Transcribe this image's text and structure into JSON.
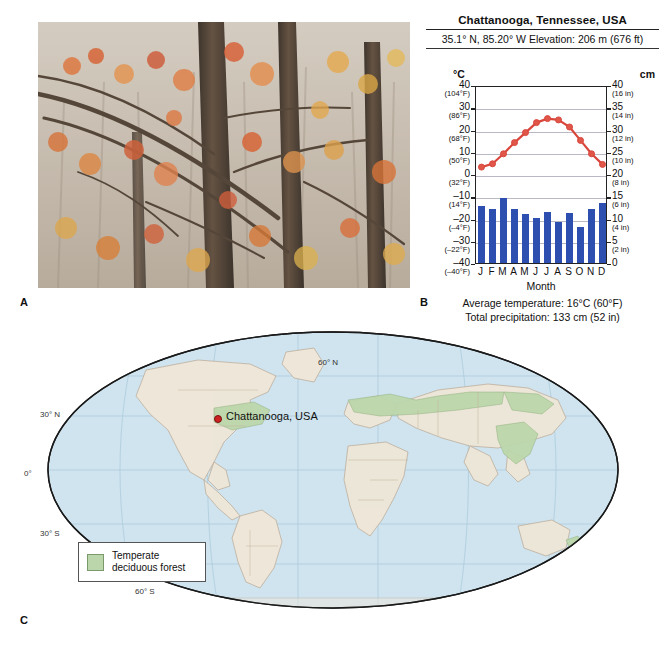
{
  "panels": {
    "a": "A",
    "b": "B",
    "c": "C"
  },
  "photo": {
    "alt": "autumn-deciduous-forest-photo"
  },
  "climograph": {
    "title": "Chattanooga, Tennessee, USA",
    "coords": "35.1° N, 85.20° W   Elevation: 206 m (676 ft)",
    "left_unit": "°C",
    "right_unit": "cm",
    "month_axis_label": "Month",
    "avg_temp": "Average temperature: 16°C (60°F)",
    "total_precip": "Total precipitation: 133 cm (52 in)",
    "left_ticks": [
      {
        "v": "40",
        "f": "(104°F)"
      },
      {
        "v": "30",
        "f": "(86°F)"
      },
      {
        "v": "20",
        "f": "(68°F)"
      },
      {
        "v": "10",
        "f": "(50°F)"
      },
      {
        "v": "0",
        "f": "(32°F)"
      },
      {
        "v": "–10",
        "f": "(14°F)"
      },
      {
        "v": "–20",
        "f": "(–4°F)"
      },
      {
        "v": "–30",
        "f": "(–22°F)"
      },
      {
        "v": "–40",
        "f": "(–40°F)"
      }
    ],
    "right_ticks": [
      {
        "v": "40",
        "f": "(16 in)"
      },
      {
        "v": "35",
        "f": "(14 in)"
      },
      {
        "v": "30",
        "f": "(12 in)"
      },
      {
        "v": "25",
        "f": "(10 in)"
      },
      {
        "v": "20",
        "f": "(8 in)"
      },
      {
        "v": "15",
        "f": "(6 in)"
      },
      {
        "v": "10",
        "f": "(4 in)"
      },
      {
        "v": "5",
        "f": "(2 in)"
      },
      {
        "v": "0",
        "f": ""
      }
    ],
    "colors": {
      "temp_line": "#d9463c",
      "temp_marker": "#e0574a",
      "precip_bar": "#2c4fb0",
      "grid": "#b9b9c6"
    }
  },
  "chart_data": {
    "type": "line",
    "title": "Chattanooga, Tennessee, USA",
    "subtitle": "35.1° N, 85.20° W   Elevation: 206 m (676 ft)",
    "xlabel": "Month",
    "ylabel": "°C",
    "y2label": "cm",
    "grid": true,
    "legend": "none",
    "categories": [
      "J",
      "F",
      "M",
      "A",
      "M",
      "J",
      "J",
      "A",
      "S",
      "O",
      "N",
      "D"
    ],
    "x_ticklabels": [
      "J",
      "F",
      "M",
      "A",
      "M",
      "J",
      "J",
      "A",
      "S",
      "O",
      "N",
      "D"
    ],
    "ylim": [
      -40,
      40
    ],
    "y2lim": [
      0,
      40
    ],
    "y_ticks": [
      40,
      30,
      20,
      10,
      0,
      -10,
      -20,
      -30,
      -40
    ],
    "y_ticklabels_f": [
      "104°F",
      "86°F",
      "68°F",
      "50°F",
      "32°F",
      "14°F",
      "-4°F",
      "-22°F",
      "-40°F"
    ],
    "y2_ticks": [
      40,
      35,
      30,
      25,
      20,
      15,
      10,
      5,
      0
    ],
    "y2_ticklabels_in": [
      "16 in",
      "14 in",
      "12 in",
      "10 in",
      "8 in",
      "6 in",
      "4 in",
      "2 in",
      ""
    ],
    "series": [
      {
        "name": "Average temperature",
        "type": "line",
        "axis": "left",
        "unit": "°C",
        "color": "#d9463c",
        "values": [
          4.0,
          5.5,
          10.0,
          15.0,
          19.5,
          24.0,
          25.8,
          25.2,
          22.0,
          16.0,
          10.0,
          5.2
        ]
      },
      {
        "name": "Precipitation",
        "type": "bar",
        "axis": "right",
        "unit": "cm",
        "color": "#2c4fb0",
        "values": [
          12.8,
          12.2,
          14.6,
          12.2,
          11.0,
          10.2,
          11.4,
          9.2,
          11.2,
          8.0,
          12.2,
          13.4
        ]
      }
    ],
    "annotations": [
      "Average temperature: 16°C (60°F)",
      "Total precipitation: 133 cm (52 in)"
    ]
  },
  "map": {
    "city_label": "Chattanooga, USA",
    "legend_line1": "Temperate",
    "legend_line2": "deciduous forest",
    "lat_labels": [
      {
        "text": "60° N",
        "x": 300,
        "y": 28
      },
      {
        "text": "30° N",
        "x": 22,
        "y": 80
      },
      {
        "text": "0°",
        "x": 6,
        "y": 139
      },
      {
        "text": "30° S",
        "x": 22,
        "y": 199
      },
      {
        "text": "60° S",
        "x": 117,
        "y": 257
      }
    ],
    "colors": {
      "ocean": "#cfe4ef",
      "land": "#ede6d9",
      "forest": "#bcd6ab",
      "border": "#b9a893",
      "outline": "#1a1a1a",
      "city_dot": "#cc2222"
    }
  }
}
